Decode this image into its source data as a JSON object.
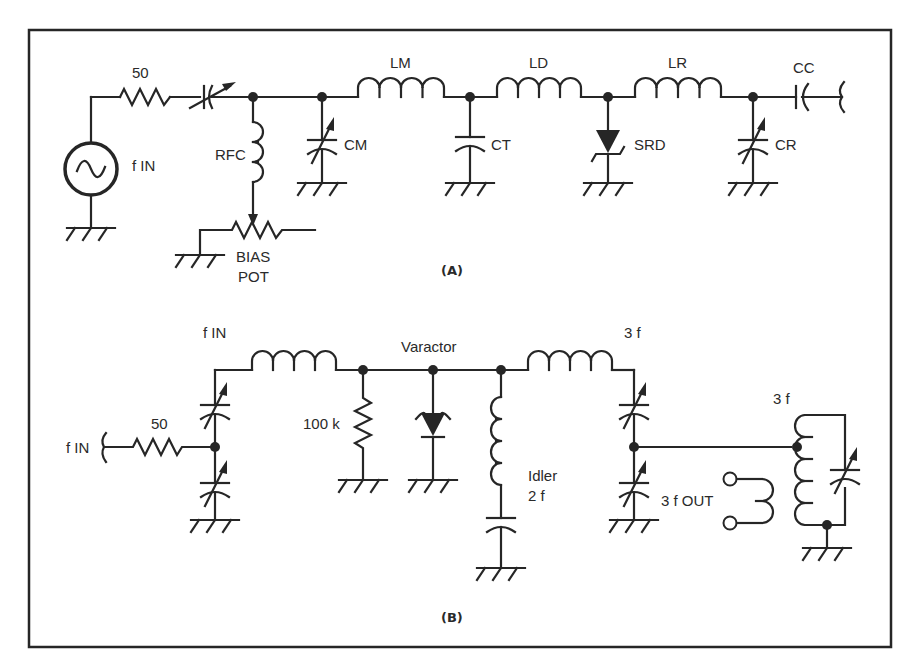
{
  "figure": {
    "frame_color": "#262626",
    "background": "#ffffff",
    "panel_a": {
      "caption": "(A)",
      "labels": {
        "source_resistor": "50",
        "source": "f IN",
        "rfc": "RFC",
        "bias_pot_line1": "BIAS",
        "bias_pot_line2": "POT",
        "cm": "CM",
        "lm": "LM",
        "ct": "CT",
        "ld": "LD",
        "srd": "SRD",
        "lr": "LR",
        "cr": "CR",
        "cc": "CC"
      },
      "components": [
        {
          "id": "source",
          "type": "ac-source",
          "label": "f IN"
        },
        {
          "id": "r50",
          "type": "resistor",
          "label": "50"
        },
        {
          "id": "c_series",
          "type": "variable-capacitor"
        },
        {
          "id": "rfc",
          "type": "inductor",
          "label": "RFC"
        },
        {
          "id": "bias_pot",
          "type": "potentiometer",
          "label": "BIAS POT"
        },
        {
          "id": "cm",
          "type": "variable-capacitor",
          "label": "CM"
        },
        {
          "id": "lm",
          "type": "inductor",
          "label": "LM"
        },
        {
          "id": "ct",
          "type": "capacitor",
          "label": "CT"
        },
        {
          "id": "ld",
          "type": "inductor",
          "label": "LD"
        },
        {
          "id": "srd",
          "type": "step-recovery-diode",
          "label": "SRD"
        },
        {
          "id": "lr",
          "type": "inductor",
          "label": "LR"
        },
        {
          "id": "cr",
          "type": "variable-capacitor",
          "label": "CR"
        },
        {
          "id": "cc",
          "type": "capacitor",
          "label": "CC"
        }
      ]
    },
    "panel_b": {
      "caption": "(B)",
      "labels": {
        "input": "f IN",
        "input_resistor": "50",
        "fin_node": "f IN",
        "bias_resistor": "100 k",
        "varactor": "Varactor",
        "idler_line1": "Idler",
        "idler_line2": "2 f",
        "output_filter": "3 f",
        "tank": "3 f",
        "output": "3 f OUT"
      },
      "components": [
        {
          "id": "r50b",
          "type": "resistor",
          "label": "50"
        },
        {
          "id": "c_in_top",
          "type": "variable-capacitor"
        },
        {
          "id": "c_in_bot",
          "type": "variable-capacitor"
        },
        {
          "id": "l_in",
          "type": "inductor",
          "label": "f IN"
        },
        {
          "id": "r100k",
          "type": "resistor",
          "label": "100 k"
        },
        {
          "id": "varactor",
          "type": "varactor-diode",
          "label": "Varactor"
        },
        {
          "id": "l_idler",
          "type": "inductor",
          "label": "Idler 2 f"
        },
        {
          "id": "c_idler",
          "type": "capacitor"
        },
        {
          "id": "l_out",
          "type": "inductor",
          "label": "3 f"
        },
        {
          "id": "c_out_top",
          "type": "variable-capacitor"
        },
        {
          "id": "c_out_bot",
          "type": "variable-capacitor"
        },
        {
          "id": "tank_coil",
          "type": "tapped-inductor",
          "label": "3 f"
        },
        {
          "id": "tank_cap",
          "type": "variable-capacitor"
        },
        {
          "id": "out_coil",
          "type": "coupling-coil",
          "label": "3 f OUT"
        }
      ]
    }
  }
}
